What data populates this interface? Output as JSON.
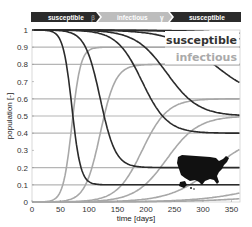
{
  "banner": {
    "stage1": "susceptible",
    "arrow1": "β",
    "stage2": "infectious",
    "arrow2": "γ",
    "stage3": "susceptible",
    "dark_color": "#2b2b2b",
    "light_color": "#bdbdbd"
  },
  "legend": {
    "susceptible": "susceptible",
    "infectious": "infectious"
  },
  "chart_data": {
    "type": "line",
    "title": "",
    "xlabel": "time [days]",
    "ylabel": "population [-]",
    "xlim": [
      0,
      365
    ],
    "ylim": [
      0,
      1
    ],
    "xticks": [
      0,
      50,
      100,
      150,
      200,
      250,
      300,
      350
    ],
    "yticks": [
      0,
      0.1,
      0.2,
      0.3,
      0.4,
      0.5,
      0.6,
      0.7,
      0.8,
      0.9,
      1
    ],
    "grid": false,
    "legend_position": "upper right",
    "model": "SIS",
    "series": [
      {
        "name": "susceptible",
        "color": "#2b2b2b",
        "equilibria": [
          0.1,
          0.2,
          0.4,
          0.5,
          0.6,
          0.8,
          0.9
        ],
        "description": "dark curves decay from 1.0 to equilibrium s* = γ/β"
      },
      {
        "name": "infectious",
        "color": "#a8a8a8",
        "equilibria": [
          0.9,
          0.8,
          0.6,
          0.5,
          0.4,
          0.2,
          0.1
        ],
        "description": "gray curves rise from 0 to 1 - s*"
      }
    ],
    "curves": [
      {
        "s_eq": 0.1,
        "rate": 0.13
      },
      {
        "s_eq": 0.2,
        "rate": 0.075
      },
      {
        "s_eq": 0.4,
        "rate": 0.045
      },
      {
        "s_eq": 0.5,
        "rate": 0.036
      },
      {
        "s_eq": 0.6,
        "rate": 0.026
      },
      {
        "s_eq": 0.8,
        "rate": 0.018
      },
      {
        "s_eq": 0.9,
        "rate": 0.015
      }
    ],
    "annotations": [
      "US map silhouette inset (lower right)"
    ]
  }
}
